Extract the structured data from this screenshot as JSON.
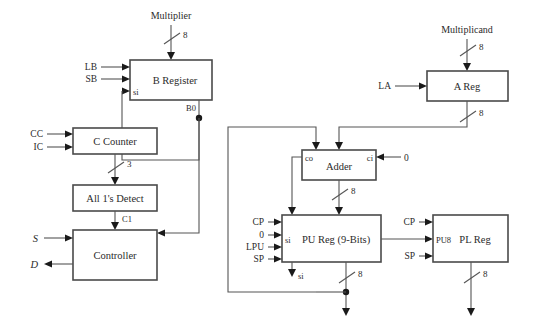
{
  "diagram": {
    "colors": {
      "background": "#ffffff",
      "block_stroke": "#4a4a4a",
      "block_fill": "#ffffff",
      "wire": "#555555",
      "junction": "#1a1a1a",
      "text": "#2b2b2b"
    },
    "blocks": [
      {
        "id": "b-register",
        "label": "B Register",
        "x": 130,
        "y": 60,
        "w": 82,
        "h": 40
      },
      {
        "id": "a-reg",
        "label": "A Reg",
        "x": 427,
        "y": 71,
        "w": 81,
        "h": 30
      },
      {
        "id": "c-counter",
        "label": "C Counter",
        "x": 73,
        "y": 128,
        "w": 84,
        "h": 26
      },
      {
        "id": "all-ones",
        "label": "All 1's Detect",
        "x": 73,
        "y": 185,
        "w": 84,
        "h": 26
      },
      {
        "id": "controller",
        "label": "Controller",
        "x": 73,
        "y": 230,
        "w": 84,
        "h": 50
      },
      {
        "id": "adder",
        "label": "Adder",
        "x": 302,
        "y": 150,
        "w": 74,
        "h": 30
      },
      {
        "id": "pu-reg",
        "label": "PU Reg (9-Bits)",
        "x": 282,
        "y": 215,
        "w": 99,
        "h": 47
      },
      {
        "id": "pl-reg",
        "label": "PL Reg",
        "x": 433,
        "y": 215,
        "w": 75,
        "h": 47
      }
    ],
    "top_inputs": [
      {
        "id": "multiplier",
        "label": "Multiplier",
        "width": "8"
      },
      {
        "id": "multiplicand",
        "label": "Multiplicand",
        "width": "8"
      }
    ],
    "control_signals": {
      "b_register": [
        "LB",
        "SB"
      ],
      "c_counter": [
        "CC",
        "IC"
      ],
      "a_reg": [
        "LA"
      ],
      "pu_reg": [
        "CP",
        "0",
        "LPU",
        "SP"
      ],
      "pl_reg": [
        "CP",
        "SP"
      ]
    },
    "port_labels": [
      {
        "id": "b-si",
        "label": "si"
      },
      {
        "id": "b0",
        "label": "B0"
      },
      {
        "id": "adder-co",
        "label": "co"
      },
      {
        "id": "adder-ci",
        "label": "ci"
      },
      {
        "id": "ci-value",
        "label": "0"
      },
      {
        "id": "pu-si",
        "label": "si"
      },
      {
        "id": "pl-si",
        "label": "si"
      },
      {
        "id": "pu8",
        "label": "PU8"
      },
      {
        "id": "c1",
        "label": "C1"
      }
    ],
    "controller_io": [
      {
        "id": "s-input",
        "label": "S",
        "direction": "in"
      },
      {
        "id": "d-output",
        "label": "D",
        "direction": "out"
      }
    ],
    "bus_widths": [
      {
        "id": "multiplier-bus",
        "label": "8"
      },
      {
        "id": "multiplicand-bus",
        "label": "8"
      },
      {
        "id": "areg-out-bus",
        "label": "8"
      },
      {
        "id": "counter-out-bus",
        "label": "3"
      },
      {
        "id": "adder-out-bus",
        "label": "8"
      },
      {
        "id": "pu-out-bus",
        "label": "8"
      },
      {
        "id": "pl-out-bus",
        "label": "8"
      }
    ]
  }
}
